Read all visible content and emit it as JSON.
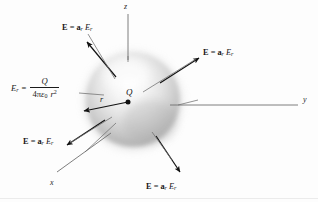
{
  "figure": {
    "background_color": "#fdfdfd",
    "ink_color": "#161616",
    "sphere": {
      "name": "gaussian-sphere",
      "center_x": 133,
      "center_y": 100,
      "radius": 47,
      "highlight_color": "#fbfbfb",
      "mid_color": "#cfcfcf",
      "edge_color": "#9a9a9a"
    },
    "axes": [
      {
        "id": "z",
        "label": "z",
        "label_x": 124,
        "label_y": 3
      },
      {
        "id": "y",
        "label": "y",
        "label_x": 303,
        "label_y": 96
      },
      {
        "id": "x",
        "label": "x",
        "label_x": 50,
        "label_y": 179
      }
    ],
    "charge": {
      "symbol": "Q",
      "label_x": 126,
      "label_y": 89
    },
    "radius_marker": {
      "symbol": "r",
      "label_x": 100,
      "label_y": 96
    },
    "equation": {
      "lhs": "E",
      "lhs_sub": "r",
      "equals": "=",
      "numerator": "Q",
      "denom_coeff": "4",
      "denom_pi": "π",
      "denom_eps": "ε",
      "denom_eps_sub": "0",
      "denom_r": "r",
      "denom_r_exp": "2"
    },
    "field_labels": [
      {
        "id": "field-label-upper-left",
        "bold_e": "E",
        "equals": "=",
        "unit_vec": "a",
        "unit_vec_sub": "r",
        "magnitude": "E",
        "magnitude_sub": "r",
        "x": 62,
        "y": 24
      },
      {
        "id": "field-label-upper-right",
        "bold_e": "E",
        "equals": "=",
        "unit_vec": "a",
        "unit_vec_sub": "r",
        "magnitude": "E",
        "magnitude_sub": "r",
        "x": 203,
        "y": 49
      },
      {
        "id": "field-label-lower-left",
        "bold_e": "E",
        "equals": "=",
        "unit_vec": "a",
        "unit_vec_sub": "r",
        "magnitude": "E",
        "magnitude_sub": "r",
        "x": 23,
        "y": 138
      },
      {
        "id": "field-label-lower-right",
        "bold_e": "E",
        "equals": "=",
        "unit_vec": "a",
        "unit_vec_sub": "r",
        "magnitude": "E",
        "magnitude_sub": "r",
        "x": 146,
        "y": 183
      }
    ]
  }
}
